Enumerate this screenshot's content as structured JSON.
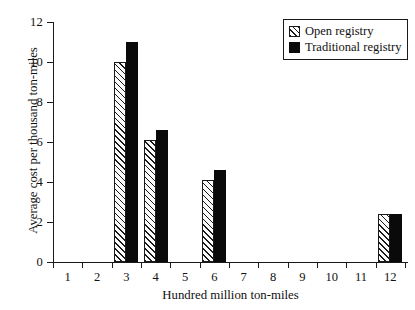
{
  "chart_data": {
    "type": "bar",
    "title": "",
    "xlabel": "Hundred million ton-miles",
    "ylabel": "Average cost per thousand ton-miles",
    "categories": [
      "1",
      "2",
      "3",
      "4",
      "5",
      "6",
      "7",
      "8",
      "9",
      "10",
      "11",
      "12"
    ],
    "xlim": [
      0,
      12
    ],
    "ylim": [
      0,
      12
    ],
    "yticks": [
      "0",
      "2",
      "4",
      "6",
      "8",
      "10",
      "12"
    ],
    "ytick_values": [
      0,
      2,
      4,
      6,
      8,
      10,
      12
    ],
    "grid": false,
    "legend_position": "top-right",
    "series": [
      {
        "name": "Open registry",
        "fill": "hatched",
        "color": "#ffffff",
        "values": [
          null,
          null,
          10.0,
          6.1,
          null,
          4.1,
          null,
          null,
          null,
          null,
          null,
          2.4
        ]
      },
      {
        "name": "Traditional registry",
        "fill": "solid",
        "color": "#0a0a0a",
        "values": [
          null,
          null,
          11.0,
          6.6,
          null,
          4.6,
          null,
          null,
          null,
          null,
          null,
          2.4
        ]
      }
    ],
    "points": [
      {
        "category": "3",
        "open_registry": 10.0,
        "traditional_registry": 11.0
      },
      {
        "category": "4",
        "open_registry": 6.1,
        "traditional_registry": 6.6
      },
      {
        "category": "6",
        "open_registry": 4.1,
        "traditional_registry": 4.6
      },
      {
        "category": "12",
        "open_registry": 2.4,
        "traditional_registry": 2.4
      }
    ]
  },
  "legend": {
    "items": [
      {
        "label": "Open registry",
        "swatch": "hatched-square-icon"
      },
      {
        "label": "Traditional registry",
        "swatch": "filled-square-icon"
      }
    ]
  }
}
